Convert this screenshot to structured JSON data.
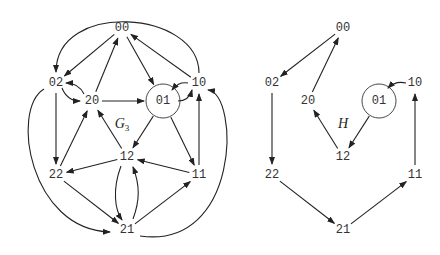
{
  "graphs": [
    {
      "name": "G3",
      "label": "G",
      "label_sub": "3",
      "label_pos": [
        122,
        128
      ],
      "circled_node": "01",
      "nodes": {
        "00": [
          122,
          28
        ],
        "02": [
          56,
          83
        ],
        "20": [
          92,
          101
        ],
        "01": [
          163,
          101
        ],
        "10": [
          199,
          83
        ],
        "12": [
          127,
          157
        ],
        "22": [
          56,
          175
        ],
        "11": [
          199,
          175
        ],
        "21": [
          127,
          230
        ]
      },
      "edges": [
        [
          "20",
          "00"
        ],
        [
          "00",
          "02"
        ],
        [
          "00",
          "01"
        ],
        [
          "10",
          "00"
        ],
        [
          "10",
          "02"
        ],
        [
          "02",
          "20"
        ],
        [
          "20",
          "02"
        ],
        [
          "02",
          "22"
        ],
        [
          "02",
          "21"
        ],
        [
          "20",
          "01"
        ],
        [
          "01",
          "10"
        ],
        [
          "10",
          "01"
        ],
        [
          "01",
          "12"
        ],
        [
          "01",
          "11"
        ],
        [
          "22",
          "20"
        ],
        [
          "12",
          "20"
        ],
        [
          "12",
          "22"
        ],
        [
          "11",
          "12"
        ],
        [
          "11",
          "10"
        ],
        [
          "22",
          "21"
        ],
        [
          "21",
          "11"
        ],
        [
          "12",
          "21"
        ],
        [
          "21",
          "12"
        ],
        [
          "21",
          "10"
        ]
      ]
    },
    {
      "name": "H",
      "label": "H",
      "label_sub": "",
      "label_pos": [
        343,
        128
      ],
      "circled_node": "01",
      "nodes": {
        "00": [
          343,
          28
        ],
        "02": [
          272,
          83
        ],
        "20": [
          308,
          101
        ],
        "01": [
          379,
          101
        ],
        "10": [
          415,
          83
        ],
        "12": [
          343,
          157
        ],
        "22": [
          272,
          175
        ],
        "11": [
          415,
          175
        ],
        "21": [
          343,
          230
        ]
      },
      "edges": [
        [
          "00",
          "02"
        ],
        [
          "20",
          "00"
        ],
        [
          "02",
          "22"
        ],
        [
          "22",
          "21"
        ],
        [
          "21",
          "11"
        ],
        [
          "11",
          "10"
        ],
        [
          "10",
          "01"
        ],
        [
          "01",
          "12"
        ],
        [
          "12",
          "20"
        ]
      ]
    }
  ]
}
